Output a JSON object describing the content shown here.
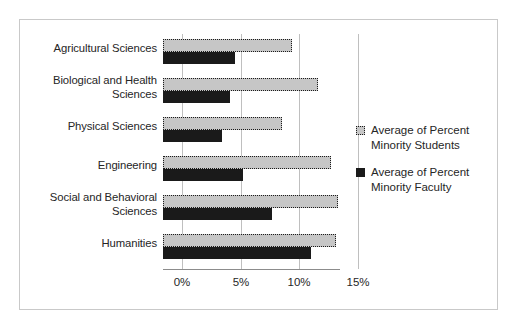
{
  "chart_data": {
    "type": "bar",
    "orientation": "horizontal",
    "title": "",
    "xlabel": "",
    "ylabel": "",
    "categories": [
      "Agricultural Sciences",
      "Biological and Health Sciences",
      "Physical Sciences",
      "Engineering",
      "Social and Behavioral Sciences",
      "Humanities"
    ],
    "series": [
      {
        "name": "Average of Percent Minority Students",
        "color": "#c6c6c6",
        "values": [
          9.4,
          11.6,
          8.5,
          12.7,
          13.3,
          13.1
        ]
      },
      {
        "name": "Average of Percent Minority Faculty",
        "color": "#1a1a1a",
        "values": [
          4.5,
          4.1,
          3.4,
          5.2,
          7.7,
          11.0
        ]
      }
    ],
    "xlim": [
      0,
      15
    ],
    "xticks": [
      0,
      5,
      10,
      15
    ],
    "xtick_labels": [
      "0%",
      "5%",
      "10%",
      "15%"
    ],
    "grid": "vertical",
    "legend_position": "right"
  },
  "legend": {
    "entries": [
      {
        "swatch": "gray-dotted-square-icon",
        "line1": "Average of Percent",
        "line2": "Minority Students"
      },
      {
        "swatch": "black-square-icon",
        "line1": "Average of Percent",
        "line2": "Minority Faculty"
      }
    ]
  }
}
